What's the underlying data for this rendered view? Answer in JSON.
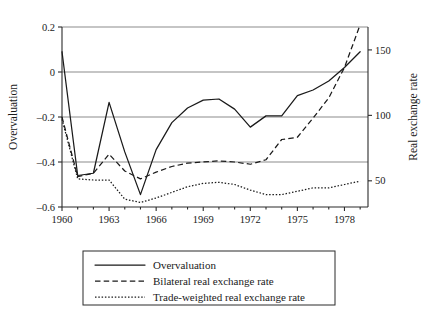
{
  "chart_data": {
    "type": "line",
    "title": "",
    "subtitle": "",
    "xlabel": "",
    "ylabel": "Overvaluation",
    "y2label": "Real exchange rate",
    "xlim": [
      1960,
      1979.5
    ],
    "ylim": [
      -0.6,
      0.2
    ],
    "y2lim": [
      30.0,
      167.5
    ],
    "grid": true,
    "legend_position": "below-center",
    "xticks": [
      1960,
      1963,
      1966,
      1969,
      1972,
      1975,
      1978
    ],
    "xtick_labels": [
      "1960",
      "1963",
      "1966",
      "1969",
      "1972",
      "1975",
      "1978"
    ],
    "yticks": [
      0.2,
      0,
      -0.2,
      -0.4,
      -0.6
    ],
    "ytick_labels": [
      "0.2",
      "0",
      "–0.2",
      "–0.4",
      "–0.6"
    ],
    "y2ticks": [
      150,
      100,
      50
    ],
    "y2tick_labels": [
      "150",
      "100",
      "50"
    ],
    "gridlines_y": [
      0.2,
      0,
      -0.2,
      -0.4
    ],
    "x": [
      1960,
      1961,
      1962,
      1963,
      1964,
      1965,
      1966,
      1967,
      1968,
      1969,
      1970,
      1971,
      1972,
      1973,
      1974,
      1975,
      1976,
      1977,
      1978,
      1979
    ],
    "series": [
      {
        "name": "Overvaluation",
        "style": "solid",
        "axis": "left",
        "values": [
          0.09,
          -0.46,
          -0.45,
          -0.135,
          -0.355,
          -0.545,
          -0.345,
          -0.225,
          -0.16,
          -0.125,
          -0.12,
          -0.165,
          -0.245,
          -0.195,
          -0.195,
          -0.105,
          -0.08,
          -0.04,
          0.02,
          0.09
        ]
      },
      {
        "name": "Bilateral real exchange rate",
        "style": "dashed",
        "axis": "left",
        "values": [
          -0.2,
          -0.465,
          -0.45,
          -0.365,
          -0.44,
          -0.475,
          -0.445,
          -0.42,
          -0.405,
          -0.4,
          -0.395,
          -0.4,
          -0.41,
          -0.39,
          -0.3,
          -0.29,
          -0.205,
          -0.115,
          0.02,
          0.21
        ]
      },
      {
        "name": "Trade-weighted real exchange rate",
        "style": "dotted",
        "axis": "left",
        "values": [
          -0.21,
          -0.475,
          -0.48,
          -0.48,
          -0.565,
          -0.58,
          -0.56,
          -0.535,
          -0.51,
          -0.495,
          -0.49,
          -0.5,
          -0.525,
          -0.545,
          -0.545,
          -0.53,
          -0.515,
          -0.515,
          -0.5,
          -0.485
        ]
      }
    ],
    "legend_entries": [
      {
        "label": "Overvaluation",
        "style": "solid"
      },
      {
        "label": "Bilateral real exchange rate",
        "style": "dashed"
      },
      {
        "label": "Trade-weighted real exchange rate",
        "style": "dotted"
      }
    ]
  }
}
